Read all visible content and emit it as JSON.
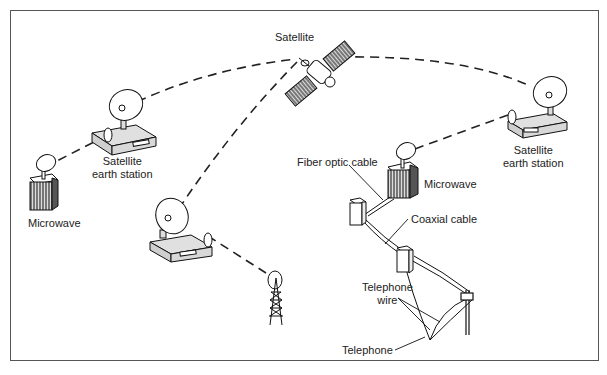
{
  "labels": {
    "satellite": "Satellite",
    "earth_station_left_1": "Satellite",
    "earth_station_left_2": "earth station",
    "earth_station_right_1": "Satellite",
    "earth_station_right_2": "earth station",
    "microwave_left": "Microwave",
    "microwave_right": "Microwave",
    "fiber_optic": "Fiber optic cable",
    "coaxial": "Coaxial cable",
    "telephone_wire_1": "Telephone",
    "telephone_wire_2": "wire",
    "telephone": "Telephone"
  },
  "nodes": [
    {
      "id": "satellite",
      "type": "satellite"
    },
    {
      "id": "earth-station-left",
      "type": "satellite-earth-station"
    },
    {
      "id": "earth-station-right",
      "type": "satellite-earth-station"
    },
    {
      "id": "earth-station-center",
      "type": "satellite-earth-station"
    },
    {
      "id": "microwave-left",
      "type": "microwave-tower"
    },
    {
      "id": "microwave-right",
      "type": "microwave-tower"
    },
    {
      "id": "radio-tower",
      "type": "antenna-tower"
    },
    {
      "id": "junction-box-1",
      "type": "junction-box"
    },
    {
      "id": "junction-box-2",
      "type": "junction-box"
    },
    {
      "id": "telephone-pole",
      "type": "telephone-pole"
    }
  ],
  "links": [
    {
      "from": "earth-station-left",
      "to": "satellite",
      "style": "dashed"
    },
    {
      "from": "satellite",
      "to": "earth-station-right",
      "style": "dashed"
    },
    {
      "from": "satellite",
      "to": "earth-station-center",
      "style": "dashed"
    },
    {
      "from": "microwave-left",
      "to": "earth-station-left",
      "style": "dashed"
    },
    {
      "from": "earth-station-right",
      "to": "microwave-right",
      "style": "dashed"
    },
    {
      "from": "earth-station-center",
      "to": "radio-tower",
      "style": "dashed"
    },
    {
      "from": "microwave-right",
      "to": "junction-box-1",
      "style": "fiber optic cable"
    },
    {
      "from": "junction-box-1",
      "to": "junction-box-2",
      "style": "coaxial cable"
    },
    {
      "from": "junction-box-2",
      "to": "telephone-pole",
      "style": "telephone wire"
    }
  ]
}
